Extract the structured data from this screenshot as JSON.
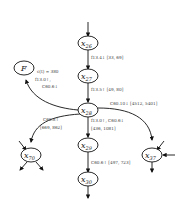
{
  "diagram": {
    "nodes": [
      {
        "id": "x26",
        "label": "x",
        "sub": "26"
      },
      {
        "id": "x27",
        "label": "x",
        "sub": "27"
      },
      {
        "id": "x28",
        "label": "x",
        "sub": "28"
      },
      {
        "id": "x29",
        "label": "x",
        "sub": "29"
      },
      {
        "id": "x30",
        "label": "x",
        "sub": "30"
      },
      {
        "id": "x70",
        "label": "x",
        "sub": "70"
      },
      {
        "id": "x37",
        "label": "x",
        "sub": "37"
      },
      {
        "id": "F",
        "label": "F",
        "sub": ""
      }
    ],
    "edges": [
      {
        "from": "x26",
        "to": "x27",
        "label": "f13.4↓ [33, 69]"
      },
      {
        "from": "x27",
        "to": "x28",
        "label": "f13.5↑ [49, 80]"
      },
      {
        "from": "x28",
        "to": "F",
        "label_1": "c(t) = 380",
        "label_2": "f13.0↑,",
        "label_3": "C60.6↓"
      },
      {
        "from": "x28",
        "to": "x37",
        "label": "C60.10↓ [4512, 5401]"
      },
      {
        "from": "x28",
        "to": "x70",
        "label_1": "C60.8↑",
        "label_2": "[669, 862]"
      },
      {
        "from": "x28",
        "to": "x29",
        "label_1": "f13.0↑, C60.6↓",
        "label_2": "[436, 1081]"
      },
      {
        "from": "x29",
        "to": "x30",
        "label": "C60.6↑ [497, 723]"
      }
    ]
  }
}
